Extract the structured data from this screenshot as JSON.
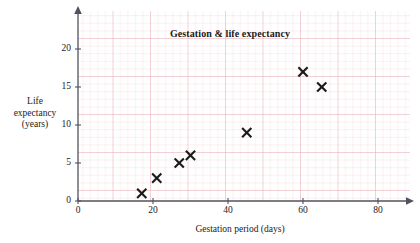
{
  "chart_data": {
    "type": "scatter",
    "title": "Gestation & life expectancy",
    "xlabel": "Gestation period (days)",
    "ylabel": "Life expectancy (years)",
    "ylabel_lines": [
      "Life",
      "expectancy",
      "(years)"
    ],
    "xlim": [
      0,
      88
    ],
    "ylim": [
      0,
      24
    ],
    "xticks": [
      0,
      20,
      40,
      60,
      80
    ],
    "xtick_labels": [
      "0",
      "20",
      "40",
      "60",
      "80"
    ],
    "yticks": [
      0,
      5,
      10,
      15,
      20
    ],
    "ytick_labels": [
      "0",
      "5",
      "10",
      "15",
      "20"
    ],
    "grid": true,
    "grid_minor_step_x": 2,
    "grid_minor_step_y": 0.5,
    "grid_major_step_x": 10,
    "grid_major_step_y": 2.5,
    "legend": null,
    "marker": "x",
    "marker_color": "#1a1a1a",
    "grid_color": "#f0c8cd",
    "grid_major_color": "#e0a8b2",
    "axis_color": "#3a3a4a",
    "points": [
      {
        "x": 17,
        "y": 1
      },
      {
        "x": 21,
        "y": 3
      },
      {
        "x": 27,
        "y": 5
      },
      {
        "x": 30,
        "y": 6
      },
      {
        "x": 45,
        "y": 9
      },
      {
        "x": 60,
        "y": 17
      },
      {
        "x": 65,
        "y": 15
      }
    ],
    "series": [
      {
        "name": "Gestation & life expectancy",
        "x": [
          17,
          21,
          27,
          30,
          45,
          60,
          65
        ],
        "values": [
          1,
          3,
          5,
          6,
          9,
          17,
          15
        ]
      }
    ]
  }
}
